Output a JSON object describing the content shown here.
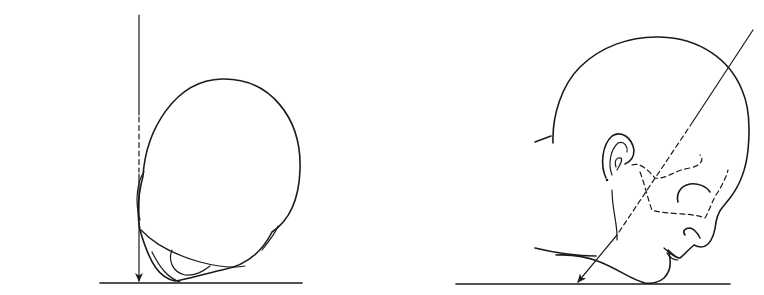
{
  "diagram": {
    "type": "radiographic-positioning-illustration",
    "panels": [
      {
        "id": "left",
        "view": "head-vertical-view",
        "description": "Head viewed from above resting on a surface, with a vertical central ray arrow tangent to the skull",
        "elements": [
          "head-outline",
          "central-ray-vertical",
          "baseline-surface"
        ]
      },
      {
        "id": "right",
        "view": "head-lateral-view",
        "description": "Head in lateral profile, chin resting on surface, with an angled central ray arrow passing through the skull",
        "elements": [
          "head-profile",
          "ear",
          "facial-bone-dashed-outline",
          "central-ray-angled",
          "baseline-surface"
        ]
      }
    ],
    "colors": {
      "ink": "#1a1a1a",
      "shading": "#d8d8d8",
      "background": "#ffffff"
    }
  }
}
